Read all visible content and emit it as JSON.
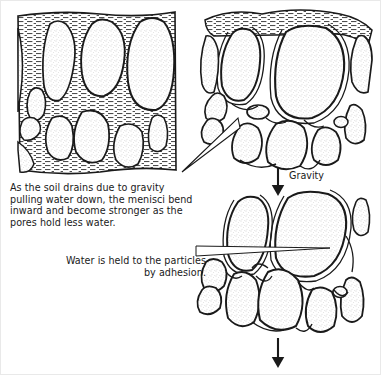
{
  "figure": {
    "width": 382,
    "height": 376,
    "background_color": "#ffffff",
    "line_color": "#1a1a1a",
    "water_fill_color": "#555555",
    "particle_fill_color": "#fbfbfb"
  },
  "captions": {
    "drainage": "As the soil drains due to gravity pulling water down, the menisci bend inward and become stronger as the pores hold less water.",
    "adhesion": "Water is held to the particles by adhesion."
  },
  "labels": {
    "gravity": "Gravity"
  },
  "panels": [
    {
      "id": "panel-saturated",
      "name": "saturated-soil-panel",
      "position": "top-left",
      "description": "Soil particles with pores completely filled with water"
    },
    {
      "id": "panel-draining",
      "name": "draining-soil-panel",
      "position": "top-right",
      "description": "Soil particles with water partly drained, menisci bending inward"
    },
    {
      "id": "panel-adhesion",
      "name": "adhesion-soil-panel",
      "position": "bottom-right",
      "description": "Soil particles with only thin adhesion water films remaining"
    }
  ],
  "arrows": [
    {
      "name": "gravity-arrow-top",
      "direction": "down",
      "label": "Gravity"
    },
    {
      "name": "gravity-arrow-bottom",
      "direction": "down",
      "label": ""
    }
  ],
  "leaders": [
    {
      "name": "drainage-leader",
      "from": "drainage-caption",
      "to": "draining-soil-panel"
    },
    {
      "name": "adhesion-leader",
      "from": "adhesion-caption",
      "to": "adhesion-soil-panel"
    }
  ]
}
